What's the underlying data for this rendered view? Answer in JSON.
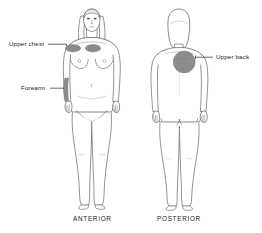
{
  "diagram": {
    "type": "anatomical-application-sites",
    "width": 262,
    "height": 233,
    "background_color": "#ffffff",
    "line_color": "#3a3a3a",
    "patch_color": "#8c8c8c",
    "text_color": "#1a1a1a"
  },
  "callouts": [
    {
      "id": "upper-chest",
      "label": "Upper chest",
      "view": "anterior",
      "site_shape": "oval-pair",
      "leader_from_x": 48,
      "leader_to_x": 66,
      "leader_y": 44
    },
    {
      "id": "forearm",
      "label": "Forearm",
      "view": "anterior",
      "site_shape": "vertical-band",
      "leader_from_x": 50,
      "leader_to_x": 63,
      "leader_y": 88
    },
    {
      "id": "upper-back",
      "label": "Upper back",
      "view": "posterior",
      "site_shape": "circle",
      "leader_from_x": 196,
      "leader_to_x": 213,
      "leader_y": 57
    }
  ],
  "views": [
    {
      "id": "anterior",
      "caption": "ANTERIOR"
    },
    {
      "id": "posterior",
      "caption": "POSTERIOR"
    }
  ],
  "sites": {
    "chest_left_oval": {
      "cx": 73,
      "cy": 48,
      "rx": 7.5,
      "ry": 3.6
    },
    "chest_right_oval": {
      "cx": 93,
      "cy": 48,
      "rx": 7.5,
      "ry": 3.6
    },
    "forearm_band": {
      "cx": 66,
      "cy": 89
    },
    "upper_back_circle": {
      "cx": 184,
      "cy": 62,
      "r": 11
    }
  }
}
